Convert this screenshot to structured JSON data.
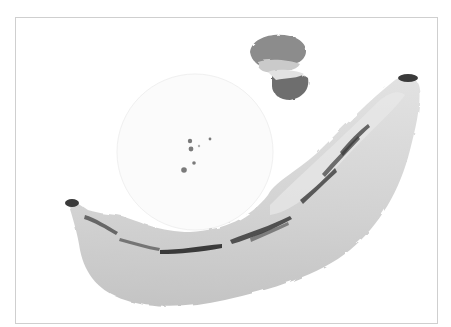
{
  "artwork": {
    "subject": "watercolor banana",
    "palette": {
      "paper": "#ffffff",
      "frame_border": "#cfcfcf",
      "banana_body": "#d4d4d4",
      "banana_shadow": "#bdbdbd",
      "banana_light": "#e6e6e6",
      "speckle": "#3a3a3a",
      "blob_light": "#bfbfbf",
      "blob_mid": "#8c8c8c",
      "blob_dark": "#6e6e6e",
      "dots": "#7a7a7a"
    }
  }
}
